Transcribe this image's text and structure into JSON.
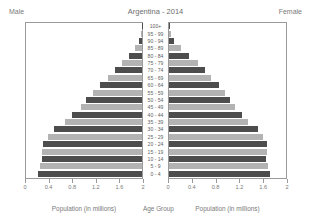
{
  "header": {
    "male_label": "Male",
    "female_label": "Female",
    "title": "Argentina - 2014"
  },
  "footer": {
    "male_caption": "Population  (in millions)",
    "center_caption": "Age Group",
    "female_caption": "Population  (in millions)"
  },
  "colors": {
    "bar_dark": "#4d4d4d",
    "bar_light": "#b3b3b3",
    "axis": "#9a9a9a",
    "text": "#7a7a7a",
    "background": "#ffffff"
  },
  "chart_data": {
    "type": "bar",
    "title": "Argentina - 2014",
    "xlabel": "Population  (in millions)",
    "ylabel": "Age Group",
    "xlim": [
      0,
      2
    ],
    "xticks": [
      0,
      0.4,
      0.8,
      1.2,
      1.6,
      2
    ],
    "xtick_labels_male": [
      "2",
      "1.6",
      "1.2",
      "0.8",
      "0.4",
      "0"
    ],
    "xtick_labels_female": [
      "0",
      "0.4",
      "0.8",
      "1.2",
      "1.6",
      "2"
    ],
    "grid": false,
    "legend": [
      "Male",
      "Female"
    ],
    "categories": [
      "0 - 4",
      "5 - 9",
      "10 - 14",
      "15 - 19",
      "20 - 24",
      "25 - 29",
      "30 - 34",
      "35 - 39",
      "40 - 44",
      "45 - 49",
      "50 - 54",
      "55 - 59",
      "60 - 64",
      "65 - 69",
      "70 - 74",
      "75 - 79",
      "80 - 84",
      "85 - 89",
      "90 - 94",
      "95 - 99",
      "100+"
    ],
    "series": [
      {
        "name": "Male",
        "values": [
          1.79,
          1.76,
          1.72,
          1.72,
          1.7,
          1.62,
          1.52,
          1.33,
          1.2,
          1.06,
          0.97,
          0.85,
          0.73,
          0.59,
          0.47,
          0.35,
          0.23,
          0.12,
          0.05,
          0.014,
          0.003
        ]
      },
      {
        "name": "Female",
        "values": [
          1.73,
          1.7,
          1.66,
          1.67,
          1.67,
          1.6,
          1.52,
          1.35,
          1.24,
          1.12,
          1.05,
          0.95,
          0.85,
          0.72,
          0.61,
          0.49,
          0.35,
          0.21,
          0.09,
          0.027,
          0.006
        ]
      }
    ]
  }
}
